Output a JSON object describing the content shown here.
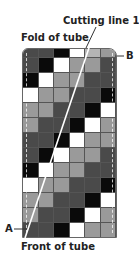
{
  "labels": {
    "cutting_line": "Cutting line 1",
    "fold": "Fold of tube",
    "front": "Front of tube",
    "point_a": "A",
    "point_b": "B"
  },
  "shades": {
    "K": "#0a0a0a",
    "M": "#4a4a4a",
    "D": "#5e5e5e",
    "G": "#9a9a9a",
    "L": "#b4b4b4",
    "W": "#ffffff"
  },
  "grid": {
    "columns": 6,
    "rows": [
      [
        "M",
        "M",
        "K",
        "W",
        "L",
        "G"
      ],
      [
        "M",
        "K",
        "W",
        "G",
        "G",
        "M"
      ],
      [
        "K",
        "W",
        "G",
        "G",
        "M",
        "M"
      ],
      [
        "W",
        "G",
        "G",
        "M",
        "M",
        "K"
      ],
      [
        "G",
        "G",
        "M",
        "M",
        "K",
        "W"
      ],
      [
        "G",
        "M",
        "M",
        "K",
        "W",
        "G"
      ],
      [
        "M",
        "M",
        "K",
        "W",
        "G",
        "G"
      ],
      [
        "M",
        "K",
        "W",
        "G",
        "G",
        "M"
      ],
      [
        "K",
        "W",
        "G",
        "G",
        "M",
        "M"
      ],
      [
        "W",
        "G",
        "G",
        "M",
        "M",
        "K"
      ],
      [
        "G",
        "G",
        "M",
        "M",
        "K",
        "W"
      ],
      [
        "G",
        "M",
        "M",
        "K",
        "W",
        "G"
      ],
      [
        "M",
        "M",
        "K",
        "W",
        "G",
        "G"
      ]
    ]
  },
  "cutting_line": {
    "from": [
      96,
      27
    ],
    "to": [
      25,
      238
    ],
    "color": "#ffffff"
  }
}
